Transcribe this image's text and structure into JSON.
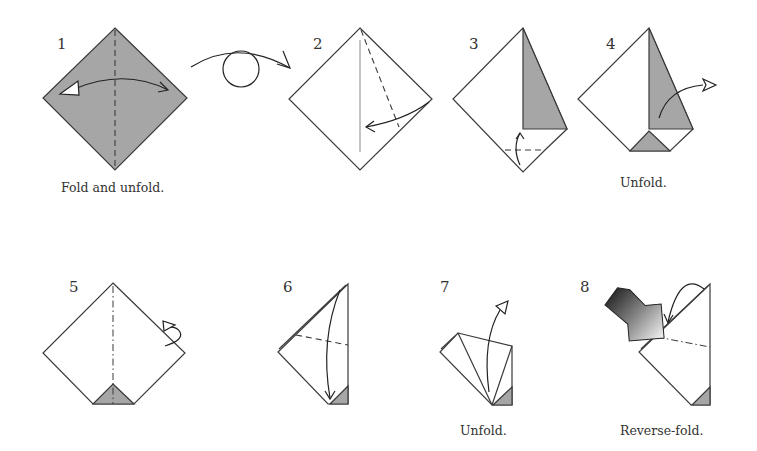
{
  "diagram": {
    "type": "origami-instructions",
    "colors": {
      "paper_white": "#ffffff",
      "paper_colored": "#a6a6a6",
      "line": "#3a3a3a",
      "push_arrow_dark": "#1a1a1a",
      "push_arrow_light": "#f0f0f0"
    },
    "steps": [
      {
        "number": "1",
        "caption": "Fold and unfold.",
        "icons": [
          "valley-fold-line",
          "fold-and-unfold-arrow"
        ]
      },
      {
        "number": "turn",
        "caption": "",
        "icons": [
          "turn-over-arrow"
        ]
      },
      {
        "number": "2",
        "caption": "",
        "icons": [
          "valley-fold-line",
          "fold-arrow"
        ]
      },
      {
        "number": "3",
        "caption": "",
        "icons": [
          "valley-fold-line",
          "fold-and-unfold-arrow"
        ]
      },
      {
        "number": "4",
        "caption": "Unfold.",
        "icons": [
          "unfold-arrow"
        ]
      },
      {
        "number": "5",
        "caption": "",
        "icons": [
          "mountain-fold-line",
          "fold-behind-arrow"
        ]
      },
      {
        "number": "6",
        "caption": "",
        "icons": [
          "valley-fold-line",
          "fold-arrow"
        ]
      },
      {
        "number": "7",
        "caption": "Unfold.",
        "icons": [
          "unfold-arrow"
        ]
      },
      {
        "number": "8",
        "caption": "Reverse-fold.",
        "icons": [
          "push-arrow",
          "mountain-fold-line",
          "reverse-fold-arrow"
        ]
      }
    ]
  }
}
